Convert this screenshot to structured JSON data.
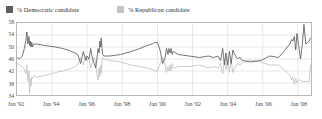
{
  "legend": {
    "position": "top-left",
    "items": [
      {
        "label": "% Democratic candidate",
        "color": "#5d5d5d",
        "key": "democratic"
      },
      {
        "label": "% Republican candidate",
        "color": "#c3c3c3",
        "key": "republican"
      }
    ]
  },
  "chart_data": {
    "type": "line",
    "title": "",
    "subtitle": "",
    "xlabel": "",
    "ylabel": "",
    "grid": true,
    "legend_position": "top-left",
    "xlim": [
      1992.0,
      2008.75
    ],
    "ylim": [
      34,
      58
    ],
    "yticks": [
      34,
      38,
      42,
      46,
      50,
      54,
      58
    ],
    "ytick_labels": [
      "34",
      "38",
      "42",
      "46",
      "50",
      "54",
      "58"
    ],
    "xticks": [
      1992,
      1994,
      1996,
      1998,
      2000,
      2002,
      2004,
      2006,
      2008
    ],
    "xtick_labels": [
      "Jan '92",
      "Jan '94",
      "Jan '96",
      "Jan '98",
      "Jan '00",
      "Jan '02",
      "Jan '04",
      "Jan '06",
      "Jan '08"
    ],
    "series": [
      {
        "name": "% Democratic candidate",
        "color": "#5d5d5d",
        "x": [
          1992.0,
          1992.15,
          1992.3,
          1992.42,
          1992.5,
          1992.56,
          1992.62,
          1992.68,
          1992.72,
          1992.76,
          1992.8,
          1992.84,
          1992.88,
          1992.95,
          1993.1,
          1993.6,
          1994.2,
          1994.6,
          1994.9,
          1995.1,
          1995.3,
          1995.45,
          1995.55,
          1995.62,
          1995.7,
          1995.78,
          1995.85,
          1995.92,
          1996.0,
          1996.1,
          1996.2,
          1996.3,
          1996.4,
          1996.48,
          1996.55,
          1996.62,
          1996.68,
          1996.72,
          1996.76,
          1996.8,
          1996.84,
          1996.88,
          1996.95,
          1997.3,
          1997.9,
          1998.5,
          1999.0,
          1999.4,
          1999.7,
          1999.85,
          2000.0,
          2000.15,
          2000.3,
          2000.42,
          2000.52,
          2000.6,
          2000.66,
          2000.72,
          2000.78,
          2000.84,
          2000.9,
          2001.2,
          2001.8,
          2002.4,
          2002.9,
          2003.2,
          2003.45,
          2003.6,
          2003.72,
          2003.82,
          2003.9,
          2004.0,
          2004.1,
          2004.2,
          2004.3,
          2004.4,
          2004.5,
          2004.58,
          2004.65,
          2004.72,
          2004.78,
          2004.84,
          2004.9,
          2005.3,
          2005.9,
          2006.4,
          2006.9,
          2007.2,
          2007.4,
          2007.55,
          2007.65,
          2007.72,
          2007.8,
          2007.88,
          2007.95,
          2008.05,
          2008.15,
          2008.25,
          2008.35,
          2008.45,
          2008.55,
          2008.65,
          2008.72
        ],
        "y": [
          46.5,
          46.0,
          47.0,
          49.5,
          52.0,
          55.0,
          51.0,
          53.5,
          50.5,
          52.0,
          50.0,
          51.5,
          50.0,
          51.0,
          51.0,
          50.5,
          50.0,
          49.5,
          49.0,
          48.5,
          48.0,
          47.5,
          46.0,
          44.5,
          46.5,
          48.5,
          47.0,
          45.5,
          47.0,
          46.0,
          49.5,
          46.0,
          44.5,
          43.0,
          46.0,
          49.5,
          48.0,
          52.0,
          50.0,
          53.0,
          49.5,
          47.5,
          47.0,
          47.0,
          47.5,
          48.5,
          49.5,
          50.5,
          51.0,
          51.5,
          51.5,
          49.0,
          44.5,
          46.0,
          49.5,
          47.5,
          49.5,
          48.0,
          49.5,
          47.5,
          48.5,
          47.5,
          47.0,
          46.5,
          47.0,
          46.5,
          47.0,
          45.5,
          49.5,
          44.0,
          48.0,
          44.0,
          48.5,
          44.5,
          49.0,
          47.5,
          46.5,
          46.0,
          46.5,
          46.5,
          46.0,
          45.5,
          45.5,
          45.0,
          45.5,
          47.0,
          46.5,
          48.5,
          50.0,
          51.0,
          52.5,
          52.0,
          53.5,
          49.0,
          54.5,
          50.5,
          46.0,
          50.5,
          57.5,
          51.0,
          51.5,
          52.0,
          53.0
        ]
      },
      {
        "name": "% Republican candidate",
        "color": "#c3c3c3",
        "x": [
          1992.0,
          1992.15,
          1992.3,
          1992.42,
          1992.5,
          1992.56,
          1992.62,
          1992.68,
          1992.72,
          1992.76,
          1992.8,
          1992.84,
          1992.88,
          1992.95,
          1993.1,
          1993.6,
          1994.2,
          1994.6,
          1994.9,
          1995.1,
          1995.3,
          1995.45,
          1995.55,
          1995.62,
          1995.7,
          1995.78,
          1995.85,
          1995.92,
          1996.0,
          1996.1,
          1996.2,
          1996.3,
          1996.4,
          1996.48,
          1996.55,
          1996.62,
          1996.68,
          1996.72,
          1996.76,
          1996.8,
          1996.84,
          1996.88,
          1996.95,
          1997.3,
          1997.9,
          1998.5,
          1999.0,
          1999.4,
          1999.7,
          1999.85,
          2000.0,
          2000.15,
          2000.3,
          2000.42,
          2000.52,
          2000.6,
          2000.66,
          2000.72,
          2000.78,
          2000.84,
          2000.9,
          2001.2,
          2001.8,
          2002.4,
          2002.9,
          2003.2,
          2003.45,
          2003.6,
          2003.72,
          2003.82,
          2003.9,
          2004.0,
          2004.1,
          2004.2,
          2004.3,
          2004.4,
          2004.5,
          2004.58,
          2004.65,
          2004.72,
          2004.78,
          2004.84,
          2004.9,
          2005.3,
          2005.9,
          2006.4,
          2006.9,
          2007.2,
          2007.4,
          2007.55,
          2007.65,
          2007.72,
          2007.8,
          2007.88,
          2007.95,
          2008.05,
          2008.15,
          2008.25,
          2008.35,
          2008.45,
          2008.55,
          2008.65,
          2008.72
        ],
        "y": [
          44.5,
          44.0,
          43.5,
          42.5,
          41.0,
          44.0,
          38.5,
          42.0,
          34.5,
          39.5,
          37.0,
          40.0,
          39.5,
          40.5,
          40.0,
          40.5,
          41.5,
          42.0,
          42.5,
          43.0,
          43.5,
          44.0,
          45.5,
          46.5,
          45.0,
          44.0,
          46.0,
          47.0,
          45.5,
          46.0,
          43.0,
          45.0,
          46.5,
          45.0,
          41.0,
          39.0,
          43.0,
          40.0,
          44.0,
          41.0,
          45.0,
          46.5,
          46.0,
          45.5,
          45.0,
          44.0,
          43.5,
          43.0,
          42.5,
          42.0,
          42.0,
          44.5,
          46.5,
          44.5,
          41.5,
          43.5,
          42.0,
          44.0,
          42.0,
          44.5,
          43.0,
          43.5,
          43.5,
          44.0,
          43.0,
          43.5,
          43.0,
          44.5,
          41.0,
          46.0,
          42.5,
          46.0,
          41.5,
          45.5,
          41.5,
          43.0,
          44.0,
          44.5,
          44.0,
          44.0,
          44.5,
          45.0,
          45.0,
          45.5,
          45.0,
          44.0,
          44.0,
          42.5,
          41.5,
          40.5,
          39.0,
          40.0,
          37.5,
          39.5,
          38.0,
          39.0,
          39.0,
          38.5,
          38.5,
          38.5,
          38.5,
          38.5,
          44.0
        ]
      }
    ]
  },
  "axis": {
    "frame_color": "#b9b9b9",
    "grid_color": "#dedede"
  }
}
